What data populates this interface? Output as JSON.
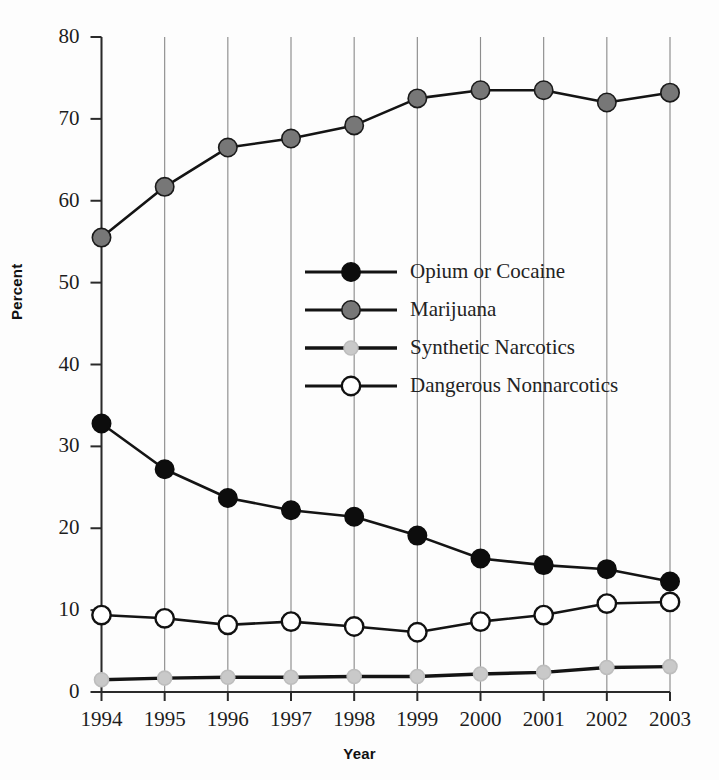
{
  "chart_data": {
    "type": "line",
    "title": "",
    "subtitle": "",
    "xlabel": "Year",
    "ylabel": "Percent",
    "categories": [
      "1994",
      "1995",
      "1996",
      "1997",
      "1998",
      "1999",
      "2000",
      "2001",
      "2002",
      "2003"
    ],
    "x": [
      1994,
      1995,
      1996,
      1997,
      1998,
      1999,
      2000,
      2001,
      2002,
      2003
    ],
    "xlim": [
      1994,
      2003
    ],
    "ylim": [
      0,
      80
    ],
    "yticks": [
      0,
      10,
      20,
      30,
      40,
      50,
      60,
      70,
      80
    ],
    "ytick_labels": [
      "0",
      "10",
      "20",
      "30",
      "40",
      "50",
      "60",
      "70",
      "80"
    ],
    "grid": "vertical-only",
    "legend_position": "center",
    "series": [
      {
        "name": "Opium or Cocaine",
        "marker": "filled-circle",
        "color": "#0d0d0d",
        "edge_color": "#0d0d0d",
        "values": [
          32.8,
          27.2,
          23.7,
          22.2,
          21.4,
          19.1,
          16.3,
          15.5,
          15.0,
          13.5
        ]
      },
      {
        "name": "Marijuana",
        "marker": "filled-circle",
        "color": "#777777",
        "edge_color": "#1a1a1a",
        "values": [
          55.5,
          61.7,
          66.5,
          67.6,
          69.2,
          72.5,
          73.5,
          73.5,
          72.0,
          73.2
        ]
      },
      {
        "name": "Synthetic Narcotics",
        "marker": "small-filled-circle",
        "color": "#c9c9c9",
        "edge_color": "#bdbdbd",
        "values": [
          1.5,
          1.7,
          1.8,
          1.8,
          1.9,
          1.9,
          2.2,
          2.4,
          3.0,
          3.1
        ]
      },
      {
        "name": "Dangerous Nonnarcotics",
        "marker": "open-circle",
        "color": "#ffffff",
        "edge_color": "#111111",
        "values": [
          9.4,
          9.0,
          8.2,
          8.6,
          8.0,
          7.3,
          8.6,
          9.4,
          10.8,
          11.0
        ]
      }
    ]
  },
  "axes": {
    "x_title": "Year",
    "y_title": "Percent"
  },
  "legend": {
    "items": [
      {
        "label": "Opium or Cocaine"
      },
      {
        "label": "Marijuana"
      },
      {
        "label": "Synthetic Narcotics"
      },
      {
        "label": "Dangerous Nonnarcotics"
      }
    ]
  },
  "style": {
    "line_color": "#141414",
    "grid_color": "#8d8d8d",
    "axis_color": "#2a2a2a",
    "background": "#fdfdfd"
  }
}
